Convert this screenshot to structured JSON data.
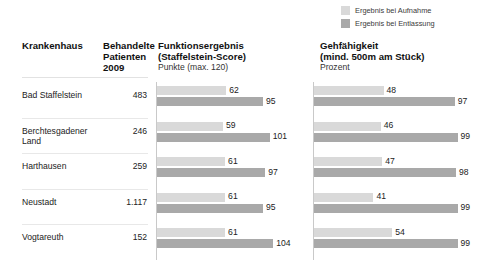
{
  "legend": {
    "items": [
      {
        "label": "Ergebnis bei Aufnahme",
        "color": "#d9d9d9",
        "name": "legend-aufnahme"
      },
      {
        "label": "Ergebnis bei Entlassung",
        "color": "#a9a9a9",
        "name": "legend-entlassung"
      }
    ]
  },
  "headers": {
    "hospital": "Krankenhaus",
    "patients_line1": "Behandelte",
    "patients_line2": "Patienten",
    "patients_line3": "2009",
    "score_line1": "Funktionsergebnis",
    "score_line2": "(Staffelstein-Score)",
    "score_unit": "Punkte (max. 120)",
    "walk_line1": "Gehfähigkeit",
    "walk_line2": "(mind. 500m am Stück)",
    "walk_unit": "Prozent"
  },
  "rows": [
    {
      "hospital": "Bad Staffelstein",
      "patients": "483",
      "score_admission": 62,
      "score_discharge": 95,
      "walk_admission": 48,
      "walk_discharge": 97
    },
    {
      "hospital": "Berchtesgadener Land",
      "patients": "246",
      "score_admission": 59,
      "score_discharge": 101,
      "walk_admission": 46,
      "walk_discharge": 99
    },
    {
      "hospital": "Harthausen",
      "patients": "259",
      "score_admission": 61,
      "score_discharge": 97,
      "walk_admission": 47,
      "walk_discharge": 98
    },
    {
      "hospital": "Neustadt",
      "patients": "1.117",
      "score_admission": 61,
      "score_discharge": 95,
      "walk_admission": 41,
      "walk_discharge": 99
    },
    {
      "hospital": "Vogtareuth",
      "patients": "152",
      "score_admission": 61,
      "score_discharge": 104,
      "walk_admission": 54,
      "walk_discharge": 99
    }
  ],
  "chart_data": [
    {
      "type": "bar",
      "title": "Funktionsergebnis (Staffelstein-Score)",
      "xlabel": "Punkte (max. 120)",
      "ylabel": "Krankenhaus",
      "orientation": "horizontal",
      "grid": false,
      "legend_position": "top-right",
      "xlim": [
        0,
        120
      ],
      "categories": [
        "Bad Staffelstein",
        "Berchtesgadener Land",
        "Harthausen",
        "Neustadt",
        "Vogtareuth"
      ],
      "series": [
        {
          "name": "Ergebnis bei Aufnahme",
          "values": [
            62,
            59,
            61,
            61,
            61
          ],
          "color": "#d9d9d9"
        },
        {
          "name": "Ergebnis bei Entlassung",
          "values": [
            95,
            101,
            97,
            95,
            104
          ],
          "color": "#a9a9a9"
        }
      ]
    },
    {
      "type": "bar",
      "title": "Gehfähigkeit (mind. 500m am Stück)",
      "xlabel": "Prozent",
      "ylabel": "Krankenhaus",
      "orientation": "horizontal",
      "grid": false,
      "legend_position": "top-right",
      "xlim": [
        0,
        100
      ],
      "categories": [
        "Bad Staffelstein",
        "Berchtesgadener Land",
        "Harthausen",
        "Neustadt",
        "Vogtareuth"
      ],
      "series": [
        {
          "name": "Ergebnis bei Aufnahme",
          "values": [
            48,
            46,
            47,
            41,
            54
          ],
          "color": "#d9d9d9"
        },
        {
          "name": "Ergebnis bei Entlassung",
          "values": [
            97,
            99,
            98,
            99,
            99
          ],
          "color": "#a9a9a9"
        }
      ]
    }
  ]
}
